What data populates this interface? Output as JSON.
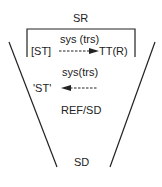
{
  "diagram": {
    "top_label": "SR",
    "bottom_label": "SD",
    "upper_arrow_label": "sys (trs)",
    "upper_source": "[ST]",
    "upper_target": "TT(R)",
    "lower_arrow_label": "sys(trs)",
    "lower_target": "'ST'",
    "middle_label": "REF/SD",
    "colors": {
      "line": "#222222",
      "background": "#ffffff"
    }
  }
}
